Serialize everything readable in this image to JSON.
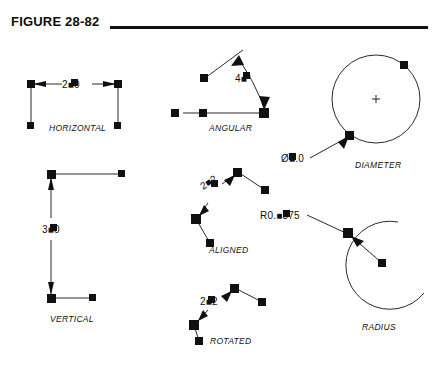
{
  "figure": {
    "title": "FIGURE 28-82",
    "rule": true
  },
  "theme": {
    "ink": "#111111",
    "grip": "#101010",
    "background": "#ffffff"
  },
  "examples": [
    {
      "id": "horizontal",
      "caption": "HORIZONTAL",
      "dim_text": "2.0",
      "text_display": "2■0",
      "note": "grip square covers the decimal point"
    },
    {
      "id": "angular",
      "caption": "ANGULAR",
      "dim_text": "45°",
      "text_display": "4■°",
      "note": "grip square covers the 5"
    },
    {
      "id": "diameter",
      "caption": "DIAMETER",
      "dim_text": "Ø2.0",
      "text_display": "Ø■.0",
      "note": "grip square covers the 2"
    },
    {
      "id": "vertical",
      "caption": "VERTICAL",
      "dim_text": "3.0",
      "text_display": "3■0",
      "note": "grip square covers the decimal point"
    },
    {
      "id": "aligned",
      "caption": "ALIGNED",
      "dim_text": "2.2",
      "text_display": "2■2",
      "note": "text rotated along dimension line"
    },
    {
      "id": "rotated",
      "caption": "ROTATED",
      "dim_text": "2.2",
      "text_display": "2■2",
      "note": "text kept horizontal"
    },
    {
      "id": "radius",
      "caption": "RADIUS",
      "dim_text": "R0.4375",
      "text_display": "R0.■375",
      "note": "grip square covers the 4"
    }
  ]
}
